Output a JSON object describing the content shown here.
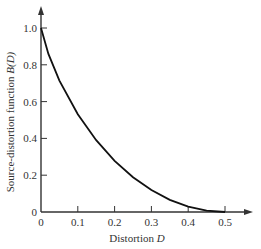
{
  "chart_data": {
    "type": "line",
    "title": "",
    "xlabel": "Distortion D",
    "ylabel": "Source-distortion function B(D)",
    "xlim": [
      0,
      0.5
    ],
    "ylim": [
      0,
      1.0
    ],
    "x_ticks": [
      "0",
      "0.1",
      "0.2",
      "0.3",
      "0.4",
      "0.5"
    ],
    "y_ticks": [
      "0",
      "0.2",
      "0.4",
      "0.6",
      "0.8",
      "1.0"
    ],
    "grid": false,
    "legend": null,
    "series": [
      {
        "name": "B(D)",
        "x": [
          0,
          0.02,
          0.05,
          0.1,
          0.15,
          0.2,
          0.25,
          0.3,
          0.35,
          0.4,
          0.45,
          0.5
        ],
        "values": [
          1.0,
          0.859,
          0.714,
          0.531,
          0.39,
          0.278,
          0.189,
          0.119,
          0.066,
          0.029,
          0.007,
          0.0
        ]
      }
    ]
  },
  "axes": {
    "x_label_text": "Distortion ",
    "x_label_var": "D",
    "y_label_text": "Source-distortion function ",
    "y_label_var": "B(D)"
  }
}
